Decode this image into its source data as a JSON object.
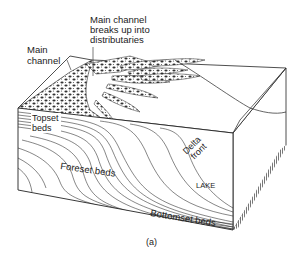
{
  "figure": {
    "panel_label": "(a)",
    "labels": {
      "main_channel": [
        "Main",
        "channel"
      ],
      "distributaries": [
        "Main channel",
        "breaks up into",
        "distributaries"
      ],
      "topset": [
        "Topset",
        "beds"
      ],
      "foreset": "Foreset beds",
      "delta_front": [
        "Delta",
        "front"
      ],
      "lake": "LAKE",
      "bottomset": "Bottomset beds"
    },
    "colors": {
      "line": "#222222",
      "background": "#ffffff",
      "side_shade": "#888888"
    }
  }
}
